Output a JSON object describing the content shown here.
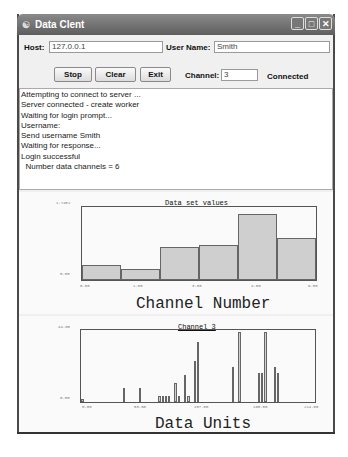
{
  "window": {
    "title": "Data Clent",
    "controls": [
      "minimize",
      "maximize",
      "close"
    ]
  },
  "form": {
    "host_label": "Host:",
    "host_value": "127.0.0.1",
    "username_label": "User Name:",
    "username_value": "Smith",
    "channel_label": "Channel:",
    "channel_value": "3",
    "status": "Connected"
  },
  "buttons": {
    "stop": "Stop",
    "clear": "Clear",
    "exit": "Exit"
  },
  "log": [
    "Attempting to connect to server ...",
    "Server connected - create worker",
    "Waiting for login prompt...",
    "Username:",
    "Send username Smith",
    "Waiting for response...",
    "Login successful",
    "  Number data channels = 6"
  ],
  "chart_data": [
    {
      "type": "bar",
      "title": "Data set values",
      "xlabel": "Channel Number",
      "ylabel": "",
      "x_ticks": [
        "0.00",
        "1.50",
        "3.00",
        "4.50",
        "6.00"
      ],
      "y_ticks": [
        "0.00",
        "1.74E2"
      ],
      "ylim": [
        0,
        174
      ],
      "xlim": [
        0,
        6
      ],
      "categories": [
        "0",
        "1",
        "2",
        "3",
        "4",
        "5"
      ],
      "values": [
        36,
        28,
        80,
        85,
        163,
        102
      ],
      "grid": false,
      "legend": null
    },
    {
      "type": "bar",
      "title": "Channel 3",
      "xlabel": "Data Units",
      "ylabel": "",
      "x_ticks": [
        "0.00",
        "53.50",
        "107.00",
        "160.50",
        "214.00"
      ],
      "y_ticks": [
        "0.00",
        "44.00"
      ],
      "ylim": [
        0,
        44
      ],
      "xlim": [
        0,
        214
      ],
      "values": [
        2,
        0,
        0,
        0,
        0,
        0,
        0,
        0,
        0,
        0,
        0,
        0,
        0,
        9,
        0,
        0,
        0,
        0,
        9,
        0,
        0,
        0,
        0,
        0,
        4,
        4,
        4,
        4,
        0,
        12,
        4,
        0,
        17,
        4,
        0,
        26,
        38,
        0,
        0,
        0,
        0,
        0,
        0,
        0,
        0,
        0,
        0,
        22,
        0,
        44,
        0,
        0,
        0,
        0,
        0,
        18,
        18,
        44,
        0,
        0,
        22,
        18,
        0,
        0,
        0,
        0,
        0,
        0,
        0,
        0,
        0,
        0,
        0
      ],
      "grid": false,
      "legend": null
    }
  ]
}
